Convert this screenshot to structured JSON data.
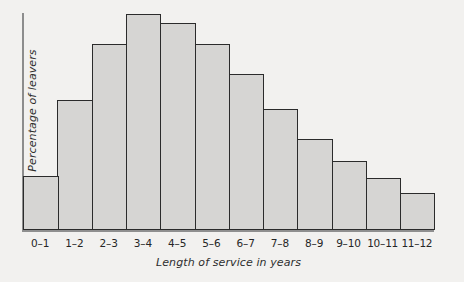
{
  "chart_data": {
    "type": "bar",
    "title": "",
    "subtitle": "",
    "xlabel": "Length of service in years",
    "ylabel": "Percentage of leavers",
    "categories": [
      "0–1",
      "1–2",
      "2–3",
      "3–4",
      "4–5",
      "5–6",
      "6–7",
      "7–8",
      "8–9",
      "9–10",
      "10–11",
      "11–12"
    ],
    "values": [
      25,
      60,
      86,
      100,
      96,
      86,
      72,
      56,
      42,
      32,
      24,
      17
    ],
    "value_unit": "relative percent of tallest bar",
    "ylim": [
      0,
      100
    ],
    "y_ticks": [],
    "x_ticks_visible": true,
    "grid": false,
    "legend": false,
    "legend_position": "none",
    "series": [
      {
        "name": "Percentage of leavers",
        "values": [
          25,
          60,
          86,
          100,
          96,
          86,
          72,
          56,
          42,
          32,
          24,
          17
        ]
      }
    ],
    "annotations": []
  },
  "style": {
    "background_color": "#f2f1ef",
    "bar_fill_color": "#d6d5d3",
    "bar_border_color": "#2b2b2b",
    "axis_color": "#8d8d8d",
    "text_color": "#262626"
  }
}
